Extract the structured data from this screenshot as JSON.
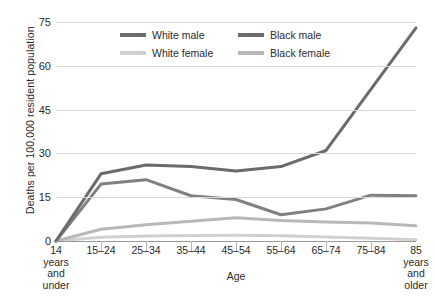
{
  "chart_data": {
    "type": "line",
    "title": "",
    "xlabel": "Age",
    "ylabel": "Deaths per 100,000 resident population",
    "ylim": [
      0,
      75
    ],
    "yticks": [
      0,
      15,
      30,
      45,
      60,
      75
    ],
    "grid": true,
    "legend_position": "top-center",
    "categories": [
      "14 years and under",
      "15–24",
      "25–34",
      "35–44",
      "45–54",
      "55–64",
      "65–74",
      "75–84",
      "85 years and older"
    ],
    "category_lines": [
      [
        "14",
        "years",
        "and",
        "under"
      ],
      [
        "15–24"
      ],
      [
        "25–34"
      ],
      [
        "35–44"
      ],
      [
        "45–54"
      ],
      [
        "55–64"
      ],
      [
        "65–74"
      ],
      [
        "75–84"
      ],
      [
        "85",
        "years",
        "and",
        "older"
      ]
    ],
    "series": [
      {
        "name": "White male",
        "color": "#808080",
        "values": [
          0,
          19.5,
          21.0,
          15.5,
          14.2,
          9.0,
          11.0,
          15.7,
          15.5
        ]
      },
      {
        "name": "Black male",
        "color": "#6b6b6b",
        "values": [
          0,
          23.0,
          26.0,
          25.5,
          24.0,
          25.5,
          31.0,
          52.0,
          73.0
        ]
      },
      {
        "name": "White female",
        "color": "#d0d0d0",
        "values": [
          0,
          1.3,
          1.7,
          1.9,
          2.0,
          1.8,
          1.4,
          0.9,
          0.4
        ]
      },
      {
        "name": "Black female",
        "color": "#b8b8b8",
        "values": [
          0,
          4.0,
          5.6,
          6.8,
          8.0,
          7.0,
          6.5,
          6.2,
          5.2
        ]
      }
    ]
  },
  "legend": {
    "entries": [
      {
        "label": "White male",
        "color": "#6b6b6b"
      },
      {
        "label": "Black male",
        "color": "#6b6b6b"
      },
      {
        "label": "White female",
        "color": "#d0d0d0"
      },
      {
        "label": "Black female",
        "color": "#b8b8b8"
      }
    ]
  },
  "axes": {
    "y_title": "Deaths per 100,000 resident population",
    "x_title": "Age",
    "y_tick_labels": [
      "0",
      "15",
      "30",
      "45",
      "60",
      "75"
    ]
  }
}
